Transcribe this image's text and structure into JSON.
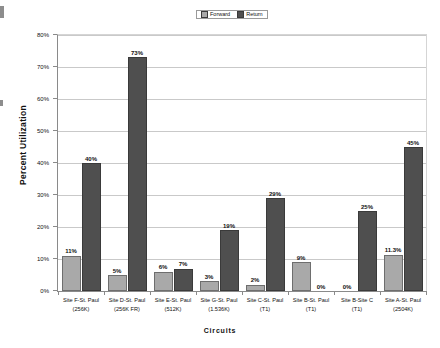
{
  "chart_data": {
    "type": "bar",
    "title": "",
    "xlabel": "Circuits",
    "ylabel": "Percent Utilization",
    "ylim": [
      0,
      80
    ],
    "ytick_labels": [
      "80%",
      "70%",
      "60%",
      "50%",
      "40%",
      "30%",
      "20%",
      "10%",
      "0%"
    ],
    "ytick_values": [
      80,
      70,
      60,
      50,
      40,
      30,
      20,
      10,
      0
    ],
    "grid": true,
    "legend_position": "top-center",
    "categories": [
      "Site F-St. Paul\n(256K)",
      "Site D-St. Paul\n(256K FR)",
      "Site E-St. Paul\n(512K)",
      "Site G-St. Paul\n(1.536K)",
      "Site C-St. Paul\n(T1)",
      "Site B-St. Paul\n(T1)",
      "Site B-Site C\n(T1)",
      "Site A-St. Paul\n(2504K)"
    ],
    "categories_lines": [
      [
        "Site F-St. Paul",
        "(256K)"
      ],
      [
        "Site D-St. Paul",
        "(256K FR)"
      ],
      [
        "Site E-St. Paul",
        "(512K)"
      ],
      [
        "Site G-St. Paul",
        "(1.536K)"
      ],
      [
        "Site C-St. Paul",
        "(T1)"
      ],
      [
        "Site B-St. Paul",
        "(T1)"
      ],
      [
        "Site B-Site C",
        "(T1)"
      ],
      [
        "Site A-St. Paul",
        "(2504K)"
      ]
    ],
    "series": [
      {
        "name": "Forward",
        "color": "#a9a9a9",
        "values": [
          11,
          5,
          6,
          3,
          2,
          9,
          0,
          11.3
        ],
        "labels": [
          "11%",
          "5%",
          "6%",
          "3%",
          "2%",
          "9%",
          "0%",
          "11.3%"
        ]
      },
      {
        "name": "Return",
        "color": "#4f4f4f",
        "values": [
          40,
          73,
          7,
          19,
          29,
          0,
          25,
          45
        ],
        "labels": [
          "40%",
          "73%",
          "7%",
          "19%",
          "29%",
          "0%",
          "25%",
          "45%"
        ]
      }
    ]
  },
  "legend": {
    "items": [
      {
        "label": "Forward",
        "color": "#a9a9a9"
      },
      {
        "label": "Return",
        "color": "#4f4f4f"
      }
    ]
  },
  "axes": {
    "y_title": "Percent Utilization",
    "x_title": "Circuits"
  }
}
